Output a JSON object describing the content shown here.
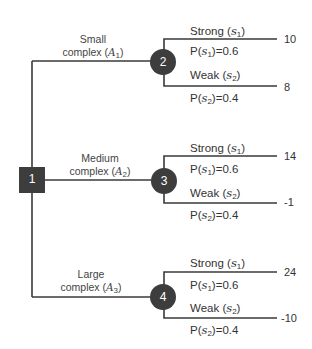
{
  "diagram": {
    "type": "decision-tree",
    "colors": {
      "line": "#3a3a3a",
      "node_fill": "#3d3d3d",
      "node_text": "#ffffff"
    },
    "decision_node": {
      "id": "1"
    },
    "alternatives": [
      {
        "label_line1": "Small",
        "label_line2": "complex",
        "sym": "A",
        "sub": "1",
        "chance_node": "2",
        "outcomes": [
          {
            "label": "Strong",
            "sym": "s",
            "sub": "1",
            "prob_prefix": "P(",
            "prob_suffix": ")=0.6",
            "value": "10"
          },
          {
            "label": "Weak",
            "sym": "s",
            "sub": "2",
            "prob_prefix": "P(",
            "prob_suffix": ")=0.4",
            "value": "8"
          }
        ]
      },
      {
        "label_line1": "Medium",
        "label_line2": "complex",
        "sym": "A",
        "sub": "2",
        "chance_node": "3",
        "outcomes": [
          {
            "label": "Strong",
            "sym": "s",
            "sub": "1",
            "prob_prefix": "P(",
            "prob_suffix": ")=0.6",
            "value": "14"
          },
          {
            "label": "Weak",
            "sym": "s",
            "sub": "2",
            "prob_prefix": "P(",
            "prob_suffix": ")=0.4",
            "value": "-1"
          }
        ]
      },
      {
        "label_line1": "Large",
        "label_line2": "complex",
        "sym": "A",
        "sub": "3",
        "chance_node": "4",
        "outcomes": [
          {
            "label": "Strong",
            "sym": "s",
            "sub": "1",
            "prob_prefix": "P(",
            "prob_suffix": ")=0.6",
            "value": "24"
          },
          {
            "label": "Weak",
            "sym": "s",
            "sub": "2",
            "prob_prefix": "P(",
            "prob_suffix": ")=0.4",
            "value": "-10"
          }
        ]
      }
    ]
  }
}
